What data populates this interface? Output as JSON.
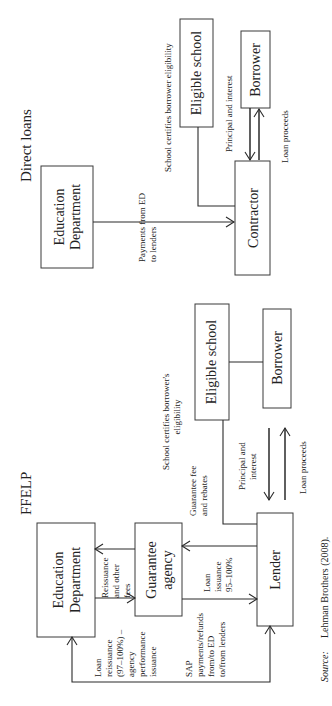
{
  "direct": {
    "title": "Direct loans",
    "ed_line1": "Education",
    "ed_line2": "Department",
    "contractor": "Contractor",
    "school": "Eligible school",
    "borrower": "Borrower",
    "pay_line1": "Payments from ED",
    "pay_line2": "to lenders",
    "certify": "School certifies borrower eligibility",
    "principal": "Principal and interest",
    "proceeds": "Loan proceeds"
  },
  "ffelp": {
    "title": "FFELP",
    "ed_line1": "Education",
    "ed_line2": "Department",
    "ga_line1": "Guarantee",
    "ga_line2": "agency",
    "lender": "Lender",
    "school": "Eligible school",
    "borrower": "Borrower",
    "reissue_fees": [
      "Reissuance",
      "and other",
      "fees"
    ],
    "loan_issuance": [
      "Loan",
      "issuance",
      "95–100%"
    ],
    "loan_reissuance": [
      "Loan",
      "reissuance",
      "(97–100%) –",
      "agency",
      "performance",
      "issuance"
    ],
    "sap": [
      "SAP",
      "payments/refunds",
      "from/to ED",
      "to/from lenders"
    ],
    "certify": [
      "School certifies borrower's",
      "eligibility"
    ],
    "guarantee_fee": [
      "Guarantee fee",
      "and rebates"
    ],
    "principal": [
      "Principal and",
      "interest"
    ],
    "proceeds": "Loan proceeds"
  },
  "source": {
    "label": "Source:",
    "text": "Lehman Brothers (2008)."
  }
}
